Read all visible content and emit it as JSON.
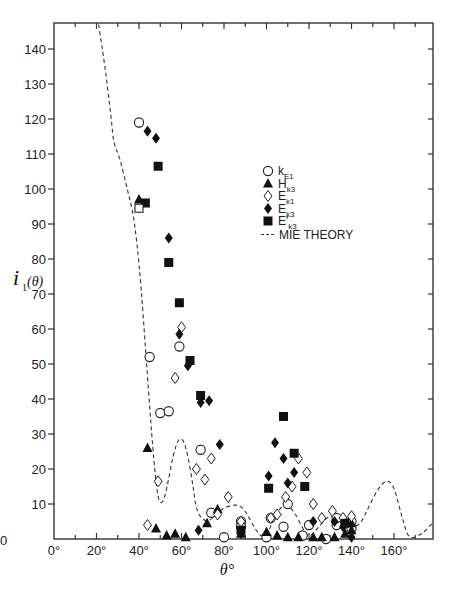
{
  "chart_data": {
    "type": "scatter",
    "title": "",
    "xlabel": "θ°",
    "ylabel": "i₁(θ)",
    "xlim": [
      0,
      178
    ],
    "ylim": [
      0,
      147
    ],
    "x_ticks": [
      0,
      20,
      40,
      60,
      80,
      100,
      120,
      140,
      160
    ],
    "x_tick_labels": [
      "0°",
      "20°",
      "40°",
      "60°",
      "80°",
      "100°",
      "120°",
      "140°",
      "160°"
    ],
    "y_ticks": [
      0,
      10,
      20,
      30,
      40,
      50,
      60,
      70,
      80,
      90,
      100,
      110,
      120,
      130,
      140
    ],
    "y_tick_labels": [
      "0",
      "10",
      "20",
      "30",
      "40",
      "50",
      "60",
      "70",
      "80",
      "90",
      "100",
      "110",
      "120",
      "130",
      "140"
    ],
    "grid": false,
    "legend_position": "upper-right (inside plot, ~x 125°-160°, y 95-85)",
    "legend": [
      {
        "marker": "open-circle",
        "label": "k",
        "sub": "E1"
      },
      {
        "marker": "filled-triangle",
        "label": "H",
        "sub": "k3"
      },
      {
        "marker": "open-diamond",
        "label": "E",
        "sub": "k1"
      },
      {
        "marker": "filled-diamond",
        "label": "E",
        "sub": "k3"
      },
      {
        "marker": "filled-square",
        "label": "E′",
        "sub": "k3"
      },
      {
        "marker": "dashed-line",
        "label": "MIE THEORY",
        "sub": ""
      }
    ],
    "series": [
      {
        "name": "k_E1",
        "marker": "open-circle",
        "points": [
          [
            40,
            119
          ],
          [
            45,
            52
          ],
          [
            50,
            36
          ],
          [
            54,
            36.5
          ],
          [
            59,
            55
          ],
          [
            69,
            25.5
          ],
          [
            74,
            7.5
          ],
          [
            80,
            0.5
          ],
          [
            88,
            5
          ],
          [
            88,
            3.5
          ],
          [
            100,
            0.5
          ],
          [
            102,
            6
          ],
          [
            108,
            3.5
          ],
          [
            110,
            10
          ],
          [
            117,
            1
          ],
          [
            120,
            4
          ],
          [
            128,
            0
          ],
          [
            133,
            4
          ],
          [
            133,
            6
          ],
          [
            140,
            5
          ],
          [
            140,
            3
          ]
        ]
      },
      {
        "name": "H_k3",
        "marker": "filled-triangle",
        "points": [
          [
            40,
            97
          ],
          [
            44,
            26
          ],
          [
            48,
            3
          ],
          [
            53,
            1
          ],
          [
            57,
            1.5
          ],
          [
            62,
            0.5
          ],
          [
            72,
            4.5
          ],
          [
            77,
            8.5
          ],
          [
            88,
            1.5
          ],
          [
            100,
            2
          ],
          [
            105,
            1
          ],
          [
            110,
            0.5
          ],
          [
            115,
            0.5
          ],
          [
            122,
            0.5
          ],
          [
            126,
            0.5
          ],
          [
            132,
            0.5
          ],
          [
            137,
            1.5
          ],
          [
            140,
            4.5
          ],
          [
            140,
            2.5
          ]
        ]
      },
      {
        "name": "E_k1",
        "marker": "open-diamond",
        "points": [
          [
            44,
            4
          ],
          [
            49,
            16.5
          ],
          [
            57,
            46
          ],
          [
            60,
            60.5
          ],
          [
            67,
            20
          ],
          [
            71,
            17
          ],
          [
            74,
            23
          ],
          [
            77,
            7
          ],
          [
            82,
            12
          ],
          [
            88,
            5
          ],
          [
            102,
            6
          ],
          [
            105,
            7
          ],
          [
            109,
            12
          ],
          [
            112,
            15
          ],
          [
            115,
            23
          ],
          [
            119,
            19
          ],
          [
            122,
            10
          ],
          [
            126,
            6
          ],
          [
            131,
            8
          ],
          [
            136,
            6
          ],
          [
            140,
            6.5
          ]
        ]
      },
      {
        "name": "E_k3",
        "marker": "filled-diamond",
        "points": [
          [
            44,
            116.5
          ],
          [
            48,
            114.5
          ],
          [
            54,
            86
          ],
          [
            59,
            58.5
          ],
          [
            63,
            49.5
          ],
          [
            69,
            39
          ],
          [
            73,
            39.5
          ],
          [
            78,
            27
          ],
          [
            68,
            2.5
          ],
          [
            88,
            1.5
          ],
          [
            101,
            18
          ],
          [
            104,
            27.5
          ],
          [
            108,
            23
          ],
          [
            113,
            19
          ],
          [
            110,
            16
          ],
          [
            122,
            5
          ],
          [
            132,
            5
          ],
          [
            136,
            3.5
          ],
          [
            140,
            0.5
          ]
        ]
      },
      {
        "name": "E'_k3",
        "marker": "filled-square",
        "points": [
          [
            43,
            96
          ],
          [
            49,
            106.5
          ],
          [
            54,
            79
          ],
          [
            59,
            67.5
          ],
          [
            64,
            51
          ],
          [
            69,
            41
          ],
          [
            88,
            2.5
          ],
          [
            101,
            14.5
          ],
          [
            108,
            35
          ],
          [
            113,
            24.5
          ],
          [
            118,
            15
          ],
          [
            137,
            4.5
          ]
        ]
      },
      {
        "name": "open-square (unlabeled)",
        "marker": "open-square",
        "points": [
          [
            40,
            94.5
          ]
        ]
      },
      {
        "name": "MIE THEORY",
        "marker": "dashed-line",
        "points": [
          [
            21,
            147
          ],
          [
            24,
            135
          ],
          [
            27,
            120
          ],
          [
            28,
            113
          ],
          [
            31,
            109
          ],
          [
            34,
            101
          ],
          [
            37,
            94
          ],
          [
            39,
            85
          ],
          [
            41,
            72
          ],
          [
            43,
            55
          ],
          [
            45,
            38
          ],
          [
            47,
            22
          ],
          [
            49,
            11
          ],
          [
            51,
            10
          ],
          [
            53,
            14
          ],
          [
            56,
            24
          ],
          [
            59,
            29.5
          ],
          [
            62,
            27
          ],
          [
            65,
            17
          ],
          [
            67,
            8
          ],
          [
            70,
            5.5
          ],
          [
            73,
            5
          ],
          [
            76,
            7
          ],
          [
            80,
            9
          ],
          [
            85,
            9.8
          ],
          [
            88,
            9.5
          ],
          [
            91,
            7
          ],
          [
            95,
            2.5
          ],
          [
            98,
            0.3
          ],
          [
            101,
            2
          ],
          [
            105,
            8
          ],
          [
            109,
            10
          ],
          [
            113,
            8
          ],
          [
            117,
            3
          ],
          [
            120,
            0.3
          ],
          [
            124,
            3
          ],
          [
            128,
            6
          ],
          [
            132,
            7
          ],
          [
            136,
            5.5
          ],
          [
            140,
            3.5
          ],
          [
            144,
            4
          ],
          [
            148,
            9
          ],
          [
            153,
            15
          ],
          [
            157,
            17
          ],
          [
            160,
            15
          ],
          [
            163,
            8
          ],
          [
            166,
            1.5
          ],
          [
            168,
            0.2
          ],
          [
            172,
            1
          ],
          [
            175,
            2.5
          ],
          [
            178,
            4.5
          ]
        ]
      }
    ]
  },
  "labels": {
    "y_axis_label": "i",
    "y_axis_sub": "1",
    "y_axis_arg": "(θ)",
    "x_axis_label": "θ°",
    "origin_label": "0",
    "legend_mie": "MIE THEORY"
  }
}
